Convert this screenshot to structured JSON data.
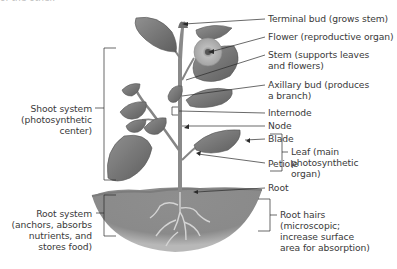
{
  "figure": {
    "top_fragment": "of the other.",
    "colors": {
      "ink": "#3a3a3a",
      "leader": "#2a2a2a",
      "leaf": "#7a7a7a",
      "leaf_dark": "#5a5a5a",
      "stem": "#8a8a8a",
      "soil": "#8c8c8c",
      "flower": "#bdbdbd"
    }
  },
  "labels": {
    "right": [
      {
        "id": "terminal-bud",
        "lines": [
          "Terminal bud (grows stem)"
        ]
      },
      {
        "id": "flower",
        "lines": [
          "Flower (reproductive organ)"
        ]
      },
      {
        "id": "stem",
        "lines": [
          "Stem (supports leaves",
          "and flowers)"
        ]
      },
      {
        "id": "axillary-bud",
        "lines": [
          "Axillary bud (produces",
          "a branch)"
        ]
      },
      {
        "id": "internode",
        "lines": [
          "Internode"
        ]
      },
      {
        "id": "node",
        "lines": [
          "Node"
        ]
      },
      {
        "id": "blade",
        "lines": [
          "Blade"
        ]
      },
      {
        "id": "petiole",
        "lines": [
          "Petiole"
        ]
      },
      {
        "id": "leaf",
        "lines": [
          "Leaf (main",
          "photosynthetic",
          "organ)"
        ]
      },
      {
        "id": "root",
        "lines": [
          "Root"
        ]
      },
      {
        "id": "root-hairs",
        "lines": [
          "Root hairs",
          "(microscopic;",
          "increase surface",
          "area for absorption)"
        ]
      }
    ],
    "left": [
      {
        "id": "shoot-system",
        "lines": [
          "Shoot system",
          "(photosynthetic",
          "center)"
        ]
      },
      {
        "id": "root-system",
        "lines": [
          "Root system",
          "(anchors, absorbs",
          "nutrients, and",
          "stores food)"
        ]
      }
    ]
  }
}
